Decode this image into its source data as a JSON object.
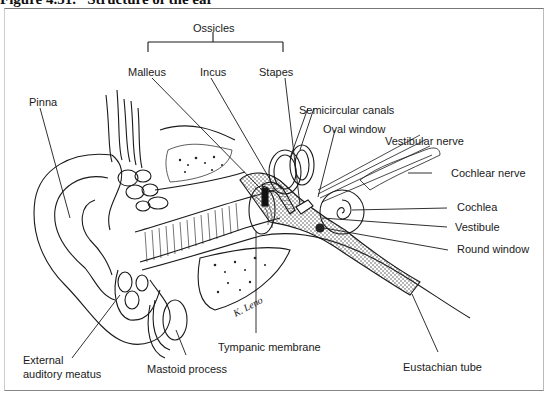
{
  "figure": {
    "title": "Figure 4.51.   Structure of the ear",
    "signature": "K. Leno"
  },
  "labels": {
    "ossicles": "Ossicles",
    "malleus": "Malleus",
    "incus": "Incus",
    "stapes": "Stapes",
    "pinna": "Pinna",
    "semicircular_canals": "Semicircular canals",
    "oval_window": "Oval window",
    "vestibular_nerve": "Vestibular nerve",
    "cochlear_nerve": "Cochlear nerve",
    "cochlea": "Cochlea",
    "vestibule": "Vestibule",
    "round_window": "Round window",
    "external_auditory_meatus_line1": "External",
    "external_auditory_meatus_line2": "auditory meatus",
    "mastoid_process": "Mastoid process",
    "tympanic_membrane": "Tympanic membrane",
    "eustachian_tube": "Eustachian tube"
  }
}
